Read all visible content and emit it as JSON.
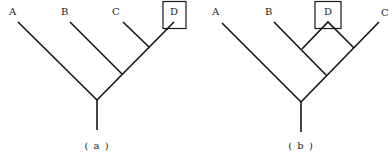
{
  "figure": {
    "colors": {
      "line": "#141414",
      "text": "#222222",
      "background": "#ffffff"
    },
    "trees": [
      {
        "id": "a",
        "caption": "( a )",
        "leaves": [
          {
            "label": "A",
            "boxed": false
          },
          {
            "label": "B",
            "boxed": false
          },
          {
            "label": "C",
            "boxed": false
          },
          {
            "label": "D",
            "boxed": true
          }
        ],
        "topology": "(A,(B,(C,D)))"
      },
      {
        "id": "b",
        "caption": "( b )",
        "leaves": [
          {
            "label": "A",
            "boxed": false
          },
          {
            "label": "B",
            "boxed": false
          },
          {
            "label": "D",
            "boxed": true
          },
          {
            "label": "C",
            "boxed": false
          }
        ],
        "topology": "(A,((B,D),(D,C))) — D attaches to both B and C lineages (reticulation)"
      }
    ]
  }
}
